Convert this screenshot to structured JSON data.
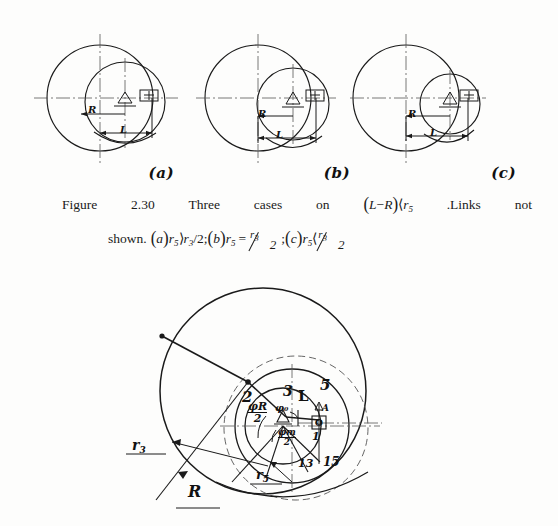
{
  "page": {
    "background": "#fdfdfc",
    "ink": "#1a1a1a"
  },
  "figures": {
    "small": [
      {
        "id": "fig-a",
        "sublabel": "(a)",
        "labels": {
          "R": "R",
          "L": "L"
        },
        "big_circle": {
          "cx": 72,
          "cy": 72,
          "r": 55
        },
        "small_circle": {
          "cx": 95,
          "cy": 76,
          "r": 40
        }
      },
      {
        "id": "fig-b",
        "sublabel": "(b)",
        "labels": {
          "R": "R",
          "L": "L"
        },
        "big_circle": {
          "cx": 70,
          "cy": 72,
          "r": 55
        },
        "small_circle": {
          "cx": 105,
          "cy": 78,
          "r": 36
        }
      },
      {
        "id": "fig-c",
        "sublabel": "(c)",
        "labels": {
          "R": "R",
          "L": "L"
        },
        "big_circle": {
          "cx": 66,
          "cy": 72,
          "r": 55
        },
        "small_circle": {
          "cx": 112,
          "cy": 78,
          "r": 30
        }
      }
    ],
    "large": {
      "labels": {
        "link2": "2",
        "link3": "3",
        "link5": "5",
        "link1": "1",
        "link13": "13",
        "link15": "15",
        "L": "L",
        "R": "R",
        "r3": "r",
        "r3_sub": "3",
        "r5": "r",
        "r5_sub": "5",
        "phiR_num": "φR",
        "phiR_den": "2",
        "phim_num": "φm",
        "phim_den": "2",
        "phi0": "φ₀",
        "pivot_O": "O",
        "pivot_A": "A"
      },
      "geometry": {
        "outer_circle": {
          "cx": 143,
          "cy": 105,
          "r": 103,
          "name": "R-circle"
        },
        "dashed_circle": {
          "cx": 176,
          "cy": 140,
          "r": 73,
          "name": "r3-dashed-circle"
        },
        "mid_circle": {
          "cx": 176,
          "cy": 140,
          "r": 58,
          "name": "mid-circle"
        },
        "inner_circle": {
          "cx": 165,
          "cy": 140,
          "r": 38,
          "name": "r5-circle"
        },
        "center_point": {
          "x": 165,
          "y": 140
        },
        "pivot_point": {
          "x": 200,
          "y": 137
        },
        "joint_point": {
          "x": 128,
          "y": 95
        },
        "rim_point": {
          "x": 42,
          "y": 50
        }
      }
    }
  },
  "caption": {
    "line1": {
      "words": [
        "Figure",
        "2.30",
        "Three",
        "cases",
        "on"
      ],
      "expr_open": "(",
      "expr_L": "L",
      "expr_minus": "−",
      "expr_R": "R",
      "expr_close": ")",
      "expr_lt": "⟨",
      "expr_r": "r",
      "expr_r_sub": "5",
      "tail_a": ".Links",
      "tail_b": "not"
    },
    "line2": {
      "shown": "shown.",
      "a_open": "(",
      "a_letter": "a",
      "a_close": ")",
      "a_r": "r",
      "a_r_sub": "5",
      "a_gt": "⟩",
      "a_r2": "r",
      "a_r2_sub": "3",
      "a_div": "/2;",
      "b_open": "(",
      "b_letter": "b",
      "b_close": ")",
      "b_r": "r",
      "b_r_sub": "5",
      "b_eq": "=",
      "b_num_r": "r",
      "b_num_sub": "3",
      "b_den": "2",
      "b_semi": ";",
      "c_open": "(",
      "c_letter": "c",
      "c_close": ")",
      "c_r": "r",
      "c_r_sub": "5",
      "c_lt": "⟨",
      "c_num_r": "r",
      "c_num_sub": "3",
      "c_den": "2"
    }
  }
}
